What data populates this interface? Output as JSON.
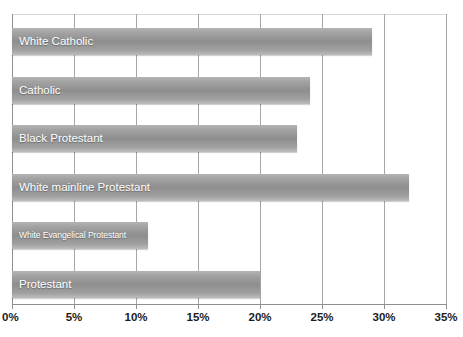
{
  "chart_data": {
    "type": "bar",
    "orientation": "horizontal",
    "title": "",
    "subtitle": "",
    "xlabel": "",
    "ylabel": "",
    "xlim": [
      0,
      35
    ],
    "grid": true,
    "legend": false,
    "value_suffix": "%",
    "categories": [
      "Protestant",
      "White Evangelical Protestant",
      "White mainline Protestant",
      "Black Protestant",
      "Catholic",
      "White Catholic"
    ],
    "values": [
      20,
      11,
      32,
      23,
      24,
      29
    ],
    "tick_labels": [
      "0%",
      "5%",
      "10%",
      "15%",
      "20%",
      "25%",
      "30%",
      "35%"
    ],
    "tick_values": [
      0,
      5,
      10,
      15,
      20,
      25,
      30,
      35
    ],
    "bars": [
      {
        "label": "White Catholic",
        "value": 29,
        "label_size": "normal"
      },
      {
        "label": "Catholic",
        "value": 24,
        "label_size": "normal"
      },
      {
        "label": "Black Protestant",
        "value": 23,
        "label_size": "normal"
      },
      {
        "label": "White mainline Protestant",
        "value": 32,
        "label_size": "normal"
      },
      {
        "label": "White Evangelical Protestant",
        "value": 11,
        "label_size": "small"
      },
      {
        "label": "Protestant",
        "value": 20,
        "label_size": "normal"
      }
    ],
    "colors": {
      "bar_light": "#b4b4b4",
      "bar_mid": "#8e8e8e",
      "bar_edge": "#bdbdbd",
      "gridline": "#a6a6a6",
      "axis": "#8f8f8f",
      "bar_label_text": "#ffffff",
      "tick_label_text": "#1b1b1b",
      "background": "#ffffff"
    }
  }
}
